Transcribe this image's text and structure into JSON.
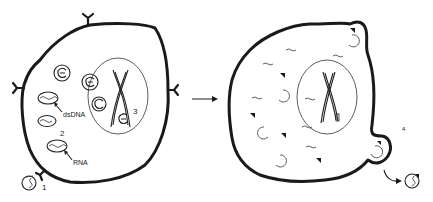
{
  "diagram": {
    "type": "viral infection cycle illustration",
    "panels": [
      {
        "id": "infected-cell",
        "description": "Cell with surface receptors, virus entry, replication in cytoplasm and nucleus",
        "labels": {
          "dsDNA": "dsDNA",
          "RNA": "RNA",
          "step1": "1",
          "step2": "2",
          "step3": "3"
        }
      },
      {
        "id": "lysing-cell",
        "description": "Cell filled with viral components; virion budding and release",
        "labels": {
          "step4": "4"
        }
      }
    ],
    "transition_arrow": "→",
    "colors": {
      "stroke": "#1a1a1a",
      "background": "#ffffff"
    }
  }
}
